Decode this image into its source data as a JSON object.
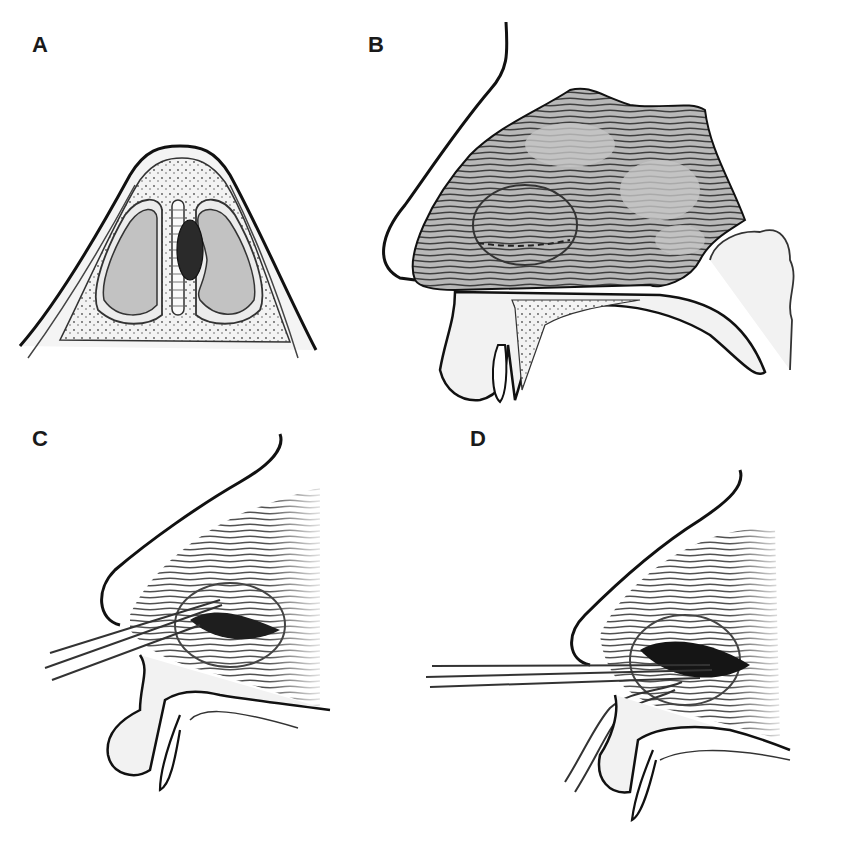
{
  "figure": {
    "panels": [
      {
        "id": "A",
        "label": "A",
        "view": "coronal cross-section of nose"
      },
      {
        "id": "B",
        "label": "B",
        "view": "sagittal view with septal mass"
      },
      {
        "id": "C",
        "label": "C",
        "view": "sagittal view with instrument incision"
      },
      {
        "id": "D",
        "label": "D",
        "view": "sagittal view with instrument and drainage"
      }
    ],
    "colors": {
      "outline": "#111111",
      "tissue_fill": "#c8c8c8",
      "light_fill": "#f1f1f1",
      "mass_fill": "#2a2a2a",
      "hatch": "#4a4a4a",
      "background": "#ffffff"
    }
  }
}
